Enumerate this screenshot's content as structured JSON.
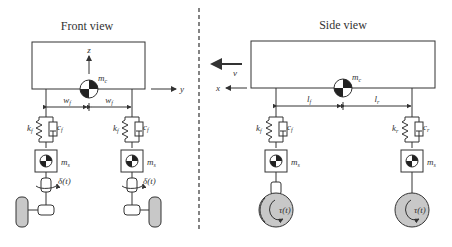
{
  "front_view": {
    "title": "Front view",
    "body_mass": "m",
    "body_mass_sub": "c",
    "axis_z": "z",
    "axis_y": "y",
    "track_left": "w",
    "track_left_sub": "f",
    "track_right": "w",
    "track_right_sub": "f",
    "spring_left": "k",
    "spring_left_sub": "f",
    "damper_left": "c",
    "damper_left_sub": "f",
    "spring_right": "k",
    "spring_right_sub": "f",
    "damper_right": "c",
    "damper_right_sub": "f",
    "unsprung_left": "m",
    "unsprung_left_sub": "s",
    "unsprung_right": "m",
    "unsprung_right_sub": "s",
    "steer_left": "δ(t)",
    "steer_right": "δ(t)"
  },
  "side_view": {
    "title": "Side view",
    "body_mass": "m",
    "body_mass_sub": "c",
    "velocity": "v",
    "axis_x": "x",
    "front_dist": "l",
    "front_dist_sub": "f",
    "rear_dist": "l",
    "rear_dist_sub": "r",
    "spring_front": "k",
    "spring_front_sub": "f",
    "damper_front": "c",
    "damper_front_sub": "f",
    "spring_rear": "k",
    "spring_rear_sub": "r",
    "damper_rear": "c",
    "damper_rear_sub": "r",
    "unsprung_front": "m",
    "unsprung_front_sub": "s",
    "unsprung_rear": "m",
    "unsprung_rear_sub": "s",
    "torque_front": "τ(t)",
    "torque_rear": "τ(t)"
  },
  "colors": {
    "line": "#333333",
    "wheel_fill": "#c8c8c8",
    "background": "#ffffff"
  }
}
